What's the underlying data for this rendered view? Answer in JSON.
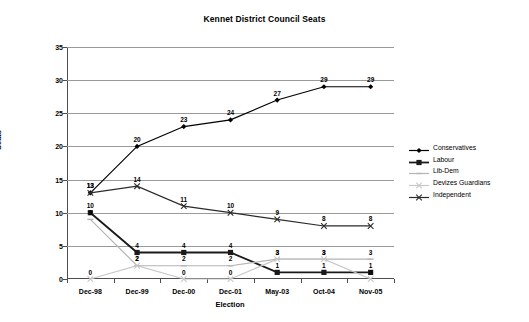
{
  "chart_data": {
    "type": "line",
    "title": "Kennet District Council Seats",
    "xlabel": "Election",
    "ylabel": "Seats",
    "categories": [
      "Dec-98",
      "Dec-99",
      "Dec-00",
      "Dec-01",
      "May-03",
      "Oct-04",
      "Nov-05"
    ],
    "ylim": [
      0,
      35
    ],
    "yticks": [
      0,
      5,
      10,
      15,
      20,
      25,
      30,
      35
    ],
    "grid": true,
    "legend_position": "right",
    "series": [
      {
        "name": "Conservatives",
        "values": [
          13,
          20,
          23,
          24,
          27,
          29,
          29
        ],
        "color": "#000000",
        "marker": "diamond"
      },
      {
        "name": "Labour",
        "values": [
          10,
          4,
          4,
          4,
          1,
          1,
          1
        ],
        "color": "#1a1a1a",
        "marker": "square"
      },
      {
        "name": "Lib-Dem",
        "values": [
          9,
          2,
          2,
          2,
          3,
          3,
          3
        ],
        "color": "#b4b4b4",
        "marker": "line"
      },
      {
        "name": "Devizes Guardians",
        "values": [
          0,
          2,
          0,
          0,
          3,
          3,
          0
        ],
        "color": "#c8c8c8",
        "marker": "cross"
      },
      {
        "name": "Independent",
        "values": [
          13,
          14,
          11,
          10,
          9,
          8,
          8
        ],
        "color": "#2b2b2b",
        "marker": "cross"
      }
    ]
  },
  "legend": {
    "items": [
      {
        "label": "Conservatives"
      },
      {
        "label": "Labour"
      },
      {
        "label": "Lib-Dem"
      },
      {
        "label": "Devizes Guardians"
      },
      {
        "label": "Independent"
      }
    ]
  }
}
